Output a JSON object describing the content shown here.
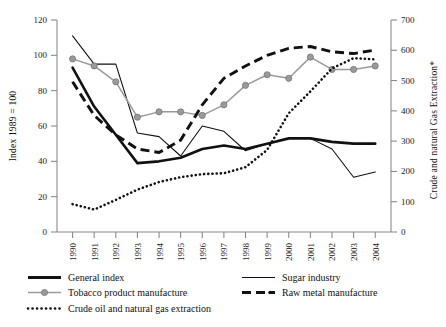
{
  "chart_data": {
    "type": "line",
    "title": "",
    "xlabel": "",
    "ylabel": "Index 1989 = 100",
    "y2label": "Crude and natural Gas Extraction*",
    "ylim": [
      0,
      120
    ],
    "y2lim": [
      0,
      700
    ],
    "ytick_labels": [
      "0",
      "20",
      "40",
      "60",
      "80",
      "100",
      "120"
    ],
    "ytick_values": [
      0,
      20,
      40,
      60,
      80,
      100,
      120
    ],
    "y2tick_labels": [
      "0",
      "100",
      "200",
      "300",
      "400",
      "500",
      "600",
      "700"
    ],
    "y2tick_values": [
      0,
      100,
      200,
      300,
      400,
      500,
      600,
      700
    ],
    "grid": false,
    "legend_position": "below",
    "categories": [
      "1990",
      "1991",
      "1992",
      "1993",
      "1994",
      "1995",
      "1996",
      "1997",
      "1998",
      "1999",
      "2000",
      "2001",
      "2002",
      "2003",
      "2004"
    ],
    "x": [
      1990,
      1991,
      1992,
      1993,
      1994,
      1995,
      1996,
      1997,
      1998,
      1999,
      2000,
      2001,
      2002,
      2003,
      2004
    ],
    "series": [
      {
        "name": "General index",
        "axis": "left",
        "style": "thick-solid",
        "color": "#111111",
        "values": [
          93,
          71,
          55,
          39,
          40,
          42,
          47,
          49,
          47,
          50,
          53,
          53,
          51,
          50,
          50
        ]
      },
      {
        "name": "Sugar industry",
        "axis": "left",
        "style": "thin-solid",
        "color": "#111111",
        "values": [
          111,
          95,
          95,
          56,
          54,
          43,
          60,
          57,
          46,
          50,
          53,
          53,
          47,
          31,
          34
        ]
      },
      {
        "name": "Tobacco product manufacture",
        "axis": "left",
        "style": "grey-marker-line",
        "color": "#9a9a9a",
        "values": [
          98,
          94,
          85,
          65,
          68,
          68,
          66,
          72,
          83,
          89,
          87,
          99,
          92,
          92,
          94
        ]
      },
      {
        "name": "Raw metal manufacture",
        "axis": "left",
        "style": "thick-dashed",
        "color": "#111111",
        "values": [
          85,
          66,
          55,
          47,
          45,
          52,
          72,
          87,
          94,
          100,
          104,
          105,
          102,
          101,
          103
        ]
      },
      {
        "name": "Crude oil and natural gas extraction",
        "axis": "right",
        "style": "dotted",
        "color": "#111111",
        "values": [
          92,
          74,
          106,
          140,
          165,
          181,
          191,
          194,
          214,
          271,
          392,
          464,
          540,
          574,
          570
        ]
      }
    ]
  },
  "axes": {
    "left": {
      "title": "Index 1989 = 100"
    },
    "right": {
      "title": "Crude and natural Gas Extraction*"
    }
  },
  "legend": {
    "items": [
      {
        "label": "General index",
        "swatch": "thick-solid"
      },
      {
        "label": "Sugar industry",
        "swatch": "thin-solid"
      },
      {
        "label": "Tobacco product manufacture",
        "swatch": "grey-marker-line"
      },
      {
        "label": "Raw metal manufacture",
        "swatch": "thick-dashed"
      },
      {
        "label": "Crude oil and natural gas extraction",
        "swatch": "dotted"
      }
    ]
  }
}
